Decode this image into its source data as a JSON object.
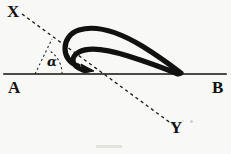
{
  "figure": {
    "background_color": "#f8f8f6",
    "ink_color": "#111111",
    "labels": {
      "x": "X",
      "y": "Y",
      "a": "A",
      "b": "B",
      "angle": "α"
    },
    "geometry": {
      "line_ab": {
        "x1": 4,
        "y1": 74,
        "x2": 226,
        "y2": 74,
        "stroke_width": 1.6
      },
      "line_xy": {
        "x1": 22,
        "y1": 14,
        "x2": 172,
        "y2": 124,
        "dash": "3 3",
        "stroke_width": 1.3
      },
      "intersection": {
        "x": 104,
        "y": 74
      },
      "angle_arc": {
        "cx": 35,
        "cy": 74,
        "radius": 27,
        "start_deg": 0,
        "end_deg": 55
      },
      "angle_vertex": {
        "x": 35,
        "y": 74
      },
      "loop_curve": {
        "stroke_width": 5.2,
        "path": "M 75 67 C 60 60 61 36 78 30 C 96 24 118 32 136 42 C 154 52 170 64 181 73 C 168 69 150 63 132 57 C 112 51 92 47 80 52 C 70 56 69 65 80 69",
        "arrow_tip": {
          "x": 92,
          "y": 70
        },
        "arrow_angle_deg": 24
      }
    }
  }
}
